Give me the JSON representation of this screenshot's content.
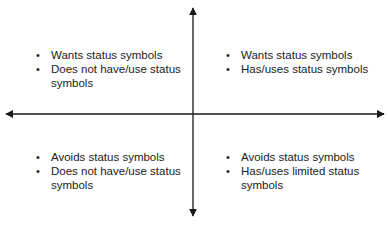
{
  "diagram": {
    "type": "quadrant",
    "axes": {
      "horizontal": {
        "bidirectional": true
      },
      "vertical": {
        "bidirectional": true
      }
    },
    "quadrants": {
      "top_left": {
        "items": [
          "Wants status symbols",
          "Does not have/use status symbols"
        ]
      },
      "top_right": {
        "items": [
          "Wants status symbols",
          "Has/uses status symbols"
        ]
      },
      "bottom_left": {
        "items": [
          "Avoids status symbols",
          "Does not have/use status symbols"
        ]
      },
      "bottom_right": {
        "items": [
          "Avoids status symbols",
          "Has/uses limited status symbols"
        ]
      }
    },
    "colors": {
      "axis": "#1a1a1a",
      "text": "#222222",
      "background": "#ffffff"
    }
  }
}
